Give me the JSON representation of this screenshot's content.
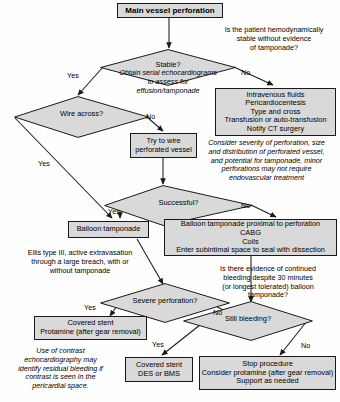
{
  "diagram": {
    "title": "Main vessel perforation",
    "type": "clinical-algorithm-flowchart",
    "colors": {
      "node_fill": "#d9d9d9",
      "node_border": "#1a1a1a",
      "text": "#000000",
      "background": "#ffffff"
    }
  },
  "nodes": {
    "start": {
      "label": "Main vessel perforation"
    },
    "iv_fluids": {
      "lines": [
        "Intravenous fluids",
        "Pericardiocentesis",
        "Type and cross",
        "Transfusion or auto-transfusion",
        "Notify CT surgery"
      ]
    },
    "try_wire": {
      "lines": [
        "Try to wire",
        "perforated vessel"
      ]
    },
    "balloon_tamponade": {
      "label": "Balloon tamponade"
    },
    "balloon_proximal": {
      "lines": [
        "Balloon tamponade proximal to perforation",
        "CABG",
        "Coils",
        "Enter subintimal space to seal with dissection"
      ]
    },
    "covered_stent_protamine": {
      "lines": [
        "Covered stent",
        "Protamine (after gear removal)"
      ]
    },
    "covered_stent_des": {
      "lines": [
        "Covered stent",
        "DES or BMS"
      ]
    },
    "stop_procedure": {
      "lines": [
        "Stop procedure",
        "Consider protamine (after gear removal)",
        "Support as needed"
      ]
    }
  },
  "decisions": {
    "stable": {
      "label": "Stable?"
    },
    "wire_across": {
      "label": "Wire across?"
    },
    "successful": {
      "label": "Successful?"
    },
    "severe_perforation": {
      "label": "Severe perforation?"
    },
    "still_bleeding": {
      "label": "Still bleeding?"
    }
  },
  "edge_labels": {
    "stable_yes": "Yes",
    "stable_no": "No",
    "wire_yes": "Yes",
    "wire_no": "No",
    "successful_yes": "Yes",
    "successful_no": "No",
    "severe_yes": "Yes",
    "severe_no": "No",
    "bleeding_yes": "Yes",
    "bleeding_no": "No"
  },
  "notes": {
    "hemodynamic_question": {
      "italic": false,
      "lines": [
        "Is the patient hemodynamically",
        "stable without evidence",
        "of tamponade?"
      ]
    },
    "serial_echo": {
      "italic": true,
      "lines": [
        "Obtain serial echocardiograms",
        "to assess for",
        "effusion/tamponade"
      ]
    },
    "consider_severity": {
      "italic": true,
      "lines": [
        "Consider severity of perforation, size",
        "and distribution of perforated vessel,",
        "and potential for tamponade, minor",
        "perforations may not require",
        "endovascular treatment"
      ]
    },
    "ellis_type": {
      "italic": false,
      "lines": [
        "Ellis type III, active extravasation",
        "through a large breach, with or",
        "without tamponade"
      ]
    },
    "continued_bleeding_question": {
      "italic": false,
      "lines": [
        "Is there evidence of continued",
        "bleeding despite 30 minutes",
        "(or longest tolerated) balloon",
        "tamponade?"
      ]
    },
    "contrast_echo": {
      "italic": true,
      "lines": [
        "Use of contrast",
        "echocardiography may",
        "identify residual bleeding if",
        "contrast is seen in the",
        "pericardial space."
      ]
    }
  }
}
